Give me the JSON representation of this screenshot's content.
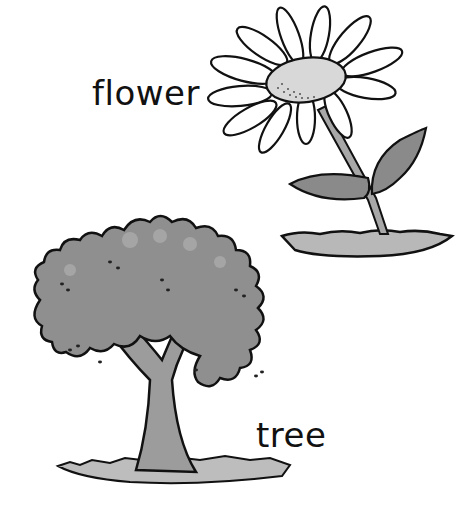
{
  "illustration": {
    "labels": {
      "flower": "flower",
      "tree": "tree"
    },
    "colors": {
      "background": "#ffffff",
      "outline": "#111111",
      "foliage": "#8f8f8f",
      "foliage_light": "#b5b5b5",
      "petal": "#ffffff",
      "flower_center": "#d8d8d8",
      "leaf": "#8a8a8a",
      "stem": "#a8a8a8",
      "ground": "#b8b8b8",
      "trunk": "#9c9c9c"
    }
  }
}
